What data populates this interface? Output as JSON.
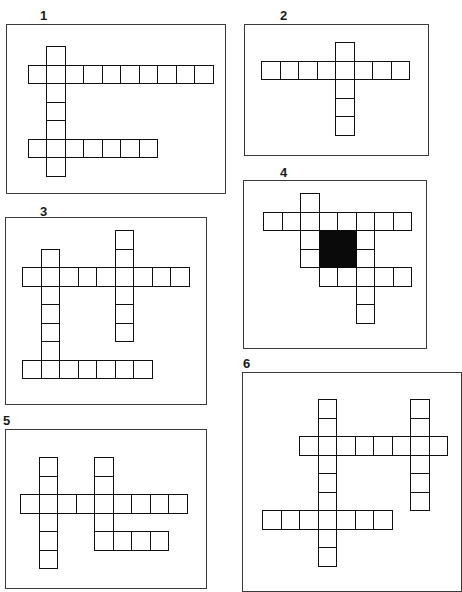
{
  "page": {
    "cell_size": 18.5,
    "colors": {
      "frame": "#3a3a3a",
      "cell_border": "#111111",
      "black_cell": "#0a0a0a",
      "background": "#ffffff"
    }
  },
  "puzzles": [
    {
      "label": "1",
      "label_pos": [
        40,
        9
      ],
      "frame": {
        "x": 6,
        "y": 24,
        "w": 220,
        "h": 170
      },
      "origin": [
        27.5,
        46
      ],
      "cells": [
        [
          0,
          1
        ],
        [
          1,
          0
        ],
        [
          1,
          1
        ],
        [
          1,
          2
        ],
        [
          1,
          3
        ],
        [
          1,
          4
        ],
        [
          1,
          5
        ],
        [
          1,
          6
        ],
        [
          1,
          7
        ],
        [
          1,
          8
        ],
        [
          1,
          9
        ],
        [
          2,
          1
        ],
        [
          3,
          1
        ],
        [
          4,
          1
        ],
        [
          5,
          0
        ],
        [
          5,
          1
        ],
        [
          5,
          2
        ],
        [
          5,
          3
        ],
        [
          5,
          4
        ],
        [
          5,
          5
        ],
        [
          5,
          6
        ],
        [
          6,
          1
        ]
      ],
      "black": []
    },
    {
      "label": "2",
      "label_pos": [
        280,
        9
      ],
      "frame": {
        "x": 244,
        "y": 24,
        "w": 185,
        "h": 132
      },
      "origin": [
        261,
        42
      ],
      "cells": [
        [
          0,
          4
        ],
        [
          1,
          0
        ],
        [
          1,
          1
        ],
        [
          1,
          2
        ],
        [
          1,
          3
        ],
        [
          1,
          4
        ],
        [
          1,
          5
        ],
        [
          1,
          6
        ],
        [
          1,
          7
        ],
        [
          2,
          4
        ],
        [
          3,
          4
        ],
        [
          4,
          4
        ]
      ],
      "black": []
    },
    {
      "label": "3",
      "label_pos": [
        40,
        205
      ],
      "frame": {
        "x": 5,
        "y": 217,
        "w": 202,
        "h": 188
      },
      "origin": [
        22,
        230
      ],
      "cells": [
        [
          0,
          5
        ],
        [
          1,
          1
        ],
        [
          1,
          5
        ],
        [
          2,
          0
        ],
        [
          2,
          1
        ],
        [
          2,
          2
        ],
        [
          2,
          3
        ],
        [
          2,
          4
        ],
        [
          2,
          5
        ],
        [
          2,
          6
        ],
        [
          2,
          7
        ],
        [
          2,
          8
        ],
        [
          3,
          1
        ],
        [
          3,
          5
        ],
        [
          4,
          1
        ],
        [
          4,
          5
        ],
        [
          5,
          1
        ],
        [
          5,
          5
        ],
        [
          6,
          1
        ],
        [
          7,
          0
        ],
        [
          7,
          1
        ],
        [
          7,
          2
        ],
        [
          7,
          3
        ],
        [
          7,
          4
        ],
        [
          7,
          5
        ],
        [
          7,
          6
        ]
      ],
      "black": []
    },
    {
      "label": "4",
      "label_pos": [
        280,
        166
      ],
      "frame": {
        "x": 243,
        "y": 180,
        "w": 184,
        "h": 169
      },
      "origin": [
        263,
        193
      ],
      "cells": [
        [
          0,
          2
        ],
        [
          1,
          0
        ],
        [
          1,
          1
        ],
        [
          1,
          2
        ],
        [
          1,
          3
        ],
        [
          1,
          4
        ],
        [
          1,
          5
        ],
        [
          1,
          6
        ],
        [
          1,
          7
        ],
        [
          2,
          2
        ],
        [
          2,
          5
        ],
        [
          3,
          2
        ],
        [
          3,
          5
        ],
        [
          4,
          3
        ],
        [
          4,
          4
        ],
        [
          4,
          5
        ],
        [
          4,
          6
        ],
        [
          4,
          7
        ],
        [
          5,
          5
        ],
        [
          6,
          5
        ]
      ],
      "black": [
        {
          "row": 2,
          "col": 3,
          "rows": 2,
          "cols": 2
        }
      ]
    },
    {
      "label": "5",
      "label_pos": [
        3,
        414
      ],
      "frame": {
        "x": 5,
        "y": 429,
        "w": 202,
        "h": 160
      },
      "origin": [
        20,
        457
      ],
      "cells": [
        [
          0,
          1
        ],
        [
          0,
          4
        ],
        [
          1,
          1
        ],
        [
          1,
          4
        ],
        [
          2,
          0
        ],
        [
          2,
          1
        ],
        [
          2,
          2
        ],
        [
          2,
          3
        ],
        [
          2,
          4
        ],
        [
          2,
          5
        ],
        [
          2,
          6
        ],
        [
          2,
          7
        ],
        [
          2,
          8
        ],
        [
          3,
          1
        ],
        [
          3,
          4
        ],
        [
          4,
          1
        ],
        [
          4,
          4
        ],
        [
          4,
          5
        ],
        [
          4,
          6
        ],
        [
          4,
          7
        ],
        [
          5,
          1
        ]
      ],
      "black": []
    },
    {
      "label": "6",
      "label_pos": [
        243,
        357
      ],
      "frame": {
        "x": 242,
        "y": 372,
        "w": 220,
        "h": 220
      },
      "origin": [
        262,
        399
      ],
      "cells": [
        [
          0,
          3
        ],
        [
          0,
          8
        ],
        [
          1,
          3
        ],
        [
          1,
          8
        ],
        [
          2,
          2
        ],
        [
          2,
          3
        ],
        [
          2,
          4
        ],
        [
          2,
          5
        ],
        [
          2,
          6
        ],
        [
          2,
          7
        ],
        [
          2,
          8
        ],
        [
          2,
          9
        ],
        [
          3,
          3
        ],
        [
          3,
          8
        ],
        [
          4,
          3
        ],
        [
          4,
          8
        ],
        [
          5,
          3
        ],
        [
          5,
          8
        ],
        [
          6,
          0
        ],
        [
          6,
          1
        ],
        [
          6,
          2
        ],
        [
          6,
          3
        ],
        [
          6,
          4
        ],
        [
          6,
          5
        ],
        [
          6,
          6
        ],
        [
          7,
          3
        ],
        [
          8,
          3
        ]
      ],
      "black": []
    }
  ]
}
